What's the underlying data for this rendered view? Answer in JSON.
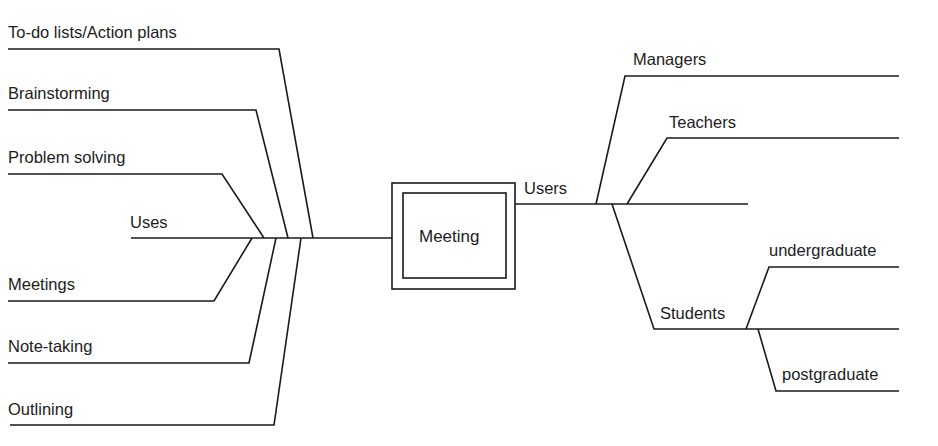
{
  "diagram": {
    "type": "mind-map",
    "center": {
      "label": "Meeting"
    },
    "left_branch": {
      "label": "Uses",
      "children": [
        {
          "label": "To-do lists/Action plans"
        },
        {
          "label": "Brainstorming"
        },
        {
          "label": "Problem solving"
        },
        {
          "label": "Meetings"
        },
        {
          "label": "Note-taking"
        },
        {
          "label": "Outlining"
        }
      ]
    },
    "right_branch": {
      "label": "Users",
      "children": [
        {
          "label": "Managers"
        },
        {
          "label": "Teachers"
        },
        {
          "label": ""
        },
        {
          "label": "Students",
          "children": [
            {
              "label": "undergraduate"
            },
            {
              "label": "postgraduate"
            }
          ]
        }
      ]
    }
  }
}
